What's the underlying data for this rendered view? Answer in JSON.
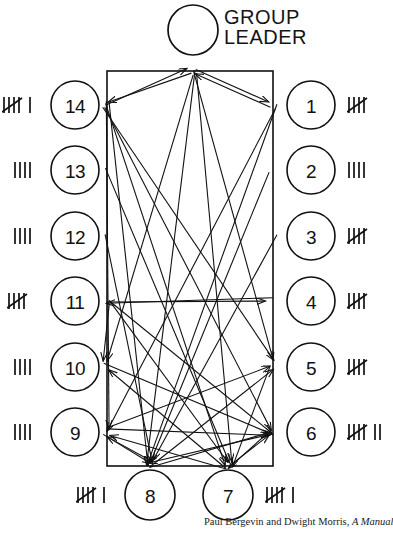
{
  "figure": {
    "type": "sociogram",
    "title_note": "Group sociogram with group leader and 14 numbered members",
    "leader": {
      "label": "GROUP\nLEADER",
      "icon": "empty-circle-icon",
      "circle": {
        "cx": 193,
        "cy": 30,
        "r": 25
      }
    },
    "frame": {
      "x": 107,
      "y": 71,
      "width": 166,
      "height": 395
    },
    "members": [
      {
        "id": "1",
        "cx": 311,
        "cy": 105,
        "r": 24,
        "side": "right",
        "tally_text": "||||/",
        "tally_count": 5
      },
      {
        "id": "2",
        "cx": 311,
        "cy": 170,
        "r": 24,
        "side": "right",
        "tally_text": "||||",
        "tally_count": 4
      },
      {
        "id": "3",
        "cx": 311,
        "cy": 236,
        "r": 24,
        "side": "right",
        "tally_text": "||||/",
        "tally_count": 5
      },
      {
        "id": "4",
        "cx": 311,
        "cy": 301,
        "r": 24,
        "side": "right",
        "tally_text": "||||/",
        "tally_count": 5
      },
      {
        "id": "5",
        "cx": 311,
        "cy": 367,
        "r": 24,
        "side": "right",
        "tally_text": "||||/",
        "tally_count": 5
      },
      {
        "id": "6",
        "cx": 311,
        "cy": 432,
        "r": 24,
        "side": "right",
        "tally_text": "||||/ ||",
        "tally_count": 7
      },
      {
        "id": "7",
        "cx": 228,
        "cy": 495,
        "r": 25,
        "side": "bottom",
        "tally_text": "||||/ |",
        "tally_count": 6
      },
      {
        "id": "8",
        "cx": 150,
        "cy": 495,
        "r": 25,
        "side": "bottom",
        "tally_text": "||||/ |",
        "tally_count": 6
      },
      {
        "id": "9",
        "cx": 75,
        "cy": 432,
        "r": 24,
        "side": "left",
        "tally_text": "||||",
        "tally_count": 4
      },
      {
        "id": "10",
        "cx": 75,
        "cy": 367,
        "r": 24,
        "side": "left",
        "tally_text": "||||",
        "tally_count": 4
      },
      {
        "id": "11",
        "cx": 75,
        "cy": 301,
        "r": 24,
        "side": "left",
        "tally_text": "||||/",
        "tally_count": 5
      },
      {
        "id": "12",
        "cx": 75,
        "cy": 236,
        "r": 24,
        "side": "left",
        "tally_text": "||||",
        "tally_count": 4
      },
      {
        "id": "13",
        "cx": 75,
        "cy": 170,
        "r": 24,
        "side": "left",
        "tally_text": "||||",
        "tally_count": 4
      },
      {
        "id": "14",
        "cx": 75,
        "cy": 105,
        "r": 24,
        "side": "left",
        "tally_text": "||||/ |",
        "tally_count": 6
      }
    ],
    "anchors": {
      "leader": {
        "x": 193,
        "y": 71
      },
      "n1": {
        "x": 273,
        "y": 105
      },
      "n2": {
        "x": 273,
        "y": 170
      },
      "n3": {
        "x": 273,
        "y": 236
      },
      "n4": {
        "x": 273,
        "y": 301
      },
      "n5": {
        "x": 273,
        "y": 367
      },
      "n6": {
        "x": 273,
        "y": 432
      },
      "n7": {
        "x": 228,
        "y": 466
      },
      "n8": {
        "x": 150,
        "y": 466
      },
      "n9": {
        "x": 107,
        "y": 432
      },
      "n10": {
        "x": 107,
        "y": 367
      },
      "n11": {
        "x": 107,
        "y": 301
      },
      "n12": {
        "x": 107,
        "y": 236
      },
      "n13": {
        "x": 107,
        "y": 170
      },
      "n14": {
        "x": 107,
        "y": 105
      }
    },
    "interaction_arrows": [
      {
        "from": "leader",
        "to": "n14"
      },
      {
        "from": "leader",
        "to": "n1"
      },
      {
        "from": "leader",
        "to": "n8"
      },
      {
        "from": "leader",
        "to": "n7"
      },
      {
        "from": "leader",
        "to": "n10"
      },
      {
        "from": "leader",
        "to": "n5"
      },
      {
        "from": "n14",
        "to": "leader"
      },
      {
        "from": "n1",
        "to": "leader"
      },
      {
        "from": "n14",
        "to": "n6"
      },
      {
        "from": "n14",
        "to": "n5"
      },
      {
        "from": "n14",
        "to": "n8"
      },
      {
        "from": "n14",
        "to": "n7"
      },
      {
        "from": "n14",
        "to": "n9"
      },
      {
        "from": "n1",
        "to": "n9"
      },
      {
        "from": "n1",
        "to": "n8"
      },
      {
        "from": "n11",
        "to": "n4"
      },
      {
        "from": "n4",
        "to": "n11"
      },
      {
        "from": "n11",
        "to": "n7"
      },
      {
        "from": "n11",
        "to": "n6"
      },
      {
        "from": "n11",
        "to": "n10"
      },
      {
        "from": "n12",
        "to": "n8"
      },
      {
        "from": "n13",
        "to": "n7"
      },
      {
        "from": "n2",
        "to": "n8"
      },
      {
        "from": "n3",
        "to": "n8"
      },
      {
        "from": "n9",
        "to": "n6"
      },
      {
        "from": "n9",
        "to": "n5"
      },
      {
        "from": "n10",
        "to": "n6"
      },
      {
        "from": "n8",
        "to": "n6"
      },
      {
        "from": "n8",
        "to": "n5"
      },
      {
        "from": "n8",
        "to": "n9"
      },
      {
        "from": "n7",
        "to": "n9"
      },
      {
        "from": "n7",
        "to": "n10"
      },
      {
        "from": "n7",
        "to": "n6"
      },
      {
        "from": "n6",
        "to": "n8"
      },
      {
        "from": "n5",
        "to": "n7"
      },
      {
        "from": "n6",
        "to": "n7"
      },
      {
        "from": "n9",
        "to": "n8"
      }
    ],
    "colors": {
      "ink": "#111111",
      "paper": "#ffffff"
    }
  },
  "caption": {
    "prefix": "Paul Bergevin and Dwight Morris, ",
    "italic": "A Manual"
  }
}
